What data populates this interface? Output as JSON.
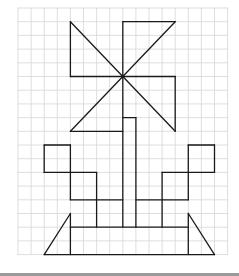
{
  "figure": {
    "grid": {
      "cols": 16,
      "rows": 18,
      "origin_x": 18,
      "origin_y": 8,
      "cell_w": 13.1,
      "cell_h": 13.7,
      "line_color": "#d6d6d6",
      "border_color": "#e2e2e2"
    },
    "stroke_color": "#1a1a1a",
    "stroke_width": 1.3,
    "center_dot": [
      8,
      5
    ],
    "segments": [
      [
        [
          4,
          1
        ],
        [
          8,
          5
        ]
      ],
      [
        [
          4,
          1
        ],
        [
          4,
          5
        ]
      ],
      [
        [
          4,
          5
        ],
        [
          8,
          5
        ]
      ],
      [
        [
          8,
          1
        ],
        [
          12,
          1
        ]
      ],
      [
        [
          12,
          1
        ],
        [
          8,
          5
        ]
      ],
      [
        [
          8,
          1
        ],
        [
          8,
          5
        ]
      ],
      [
        [
          8,
          5
        ],
        [
          12,
          5
        ]
      ],
      [
        [
          12,
          5
        ],
        [
          12,
          9
        ]
      ],
      [
        [
          12,
          9
        ],
        [
          8,
          5
        ]
      ],
      [
        [
          4,
          9
        ],
        [
          8,
          5
        ]
      ],
      [
        [
          4,
          9
        ],
        [
          8,
          9
        ]
      ],
      [
        [
          8,
          5
        ],
        [
          8,
          16
        ]
      ],
      [
        [
          8,
          8
        ],
        [
          9,
          8
        ]
      ],
      [
        [
          9,
          8
        ],
        [
          9,
          16
        ]
      ],
      [
        [
          2,
          10
        ],
        [
          4,
          10
        ]
      ],
      [
        [
          2,
          10
        ],
        [
          2,
          12
        ]
      ],
      [
        [
          2,
          12
        ],
        [
          4,
          12
        ]
      ],
      [
        [
          4,
          10
        ],
        [
          4,
          14
        ]
      ],
      [
        [
          4,
          12
        ],
        [
          6,
          12
        ]
      ],
      [
        [
          6,
          12
        ],
        [
          6,
          16
        ]
      ],
      [
        [
          4,
          14
        ],
        [
          8,
          14
        ]
      ],
      [
        [
          13,
          10
        ],
        [
          15,
          10
        ]
      ],
      [
        [
          15,
          10
        ],
        [
          15,
          12
        ]
      ],
      [
        [
          13,
          12
        ],
        [
          15,
          12
        ]
      ],
      [
        [
          13,
          10
        ],
        [
          13,
          14
        ]
      ],
      [
        [
          11,
          12
        ],
        [
          13,
          12
        ]
      ],
      [
        [
          11,
          12
        ],
        [
          11,
          16
        ]
      ],
      [
        [
          9,
          14
        ],
        [
          13,
          14
        ]
      ],
      [
        [
          4,
          16
        ],
        [
          13,
          16
        ]
      ],
      [
        [
          4,
          15
        ],
        [
          4,
          18
        ]
      ],
      [
        [
          13,
          15
        ],
        [
          13,
          18
        ]
      ],
      [
        [
          2,
          18
        ],
        [
          15,
          18
        ]
      ],
      [
        [
          4,
          15
        ],
        [
          2,
          18
        ]
      ],
      [
        [
          13,
          15
        ],
        [
          15,
          18
        ]
      ]
    ]
  },
  "footer": {
    "bar_color": "#9a9a9a"
  }
}
